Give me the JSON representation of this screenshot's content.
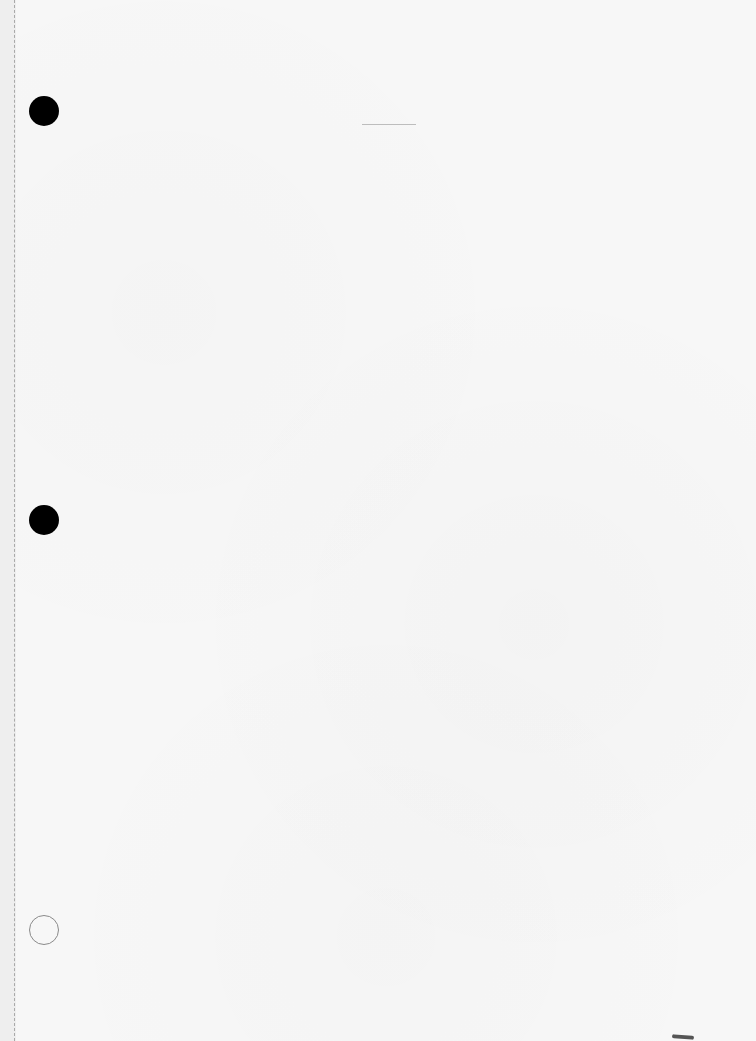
{
  "document": {
    "type": "blank-punched-sheet",
    "background_color": "#f7f7f7",
    "margin_color": "#eeeeee",
    "punch_holes": [
      {
        "position": "top",
        "style": "filled",
        "color": "#000000"
      },
      {
        "position": "middle",
        "style": "filled",
        "color": "#000000"
      },
      {
        "position": "bottom",
        "style": "outline",
        "color": "#8a8a8a"
      }
    ],
    "text": ""
  }
}
